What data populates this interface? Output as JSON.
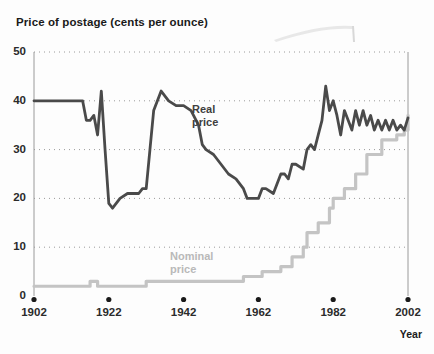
{
  "chart_data": {
    "type": "line",
    "title": "Price of postage (cents per ounce)",
    "xlabel": "Year",
    "ylabel": "",
    "xlim": [
      1902,
      2002
    ],
    "ylim": [
      0,
      50
    ],
    "grid": "dotted-horizontal",
    "legend": "inline-annotations",
    "y_ticks": [
      0,
      10,
      20,
      30,
      40,
      50
    ],
    "x_ticks": [
      1902,
      1922,
      1942,
      1962,
      1982,
      2002
    ],
    "annotations": [
      {
        "name": "real-price",
        "text_line1": "Real",
        "text_line2": "price",
        "color": "#4a4a4a"
      },
      {
        "name": "nominal-price",
        "text_line1": "Nominal",
        "text_line2": "price",
        "color": "#b9b9b9"
      }
    ],
    "series": [
      {
        "name": "Real price",
        "color": "#4a4a4a",
        "x": [
          1902,
          1907,
          1912,
          1915,
          1916,
          1917,
          1918,
          1919,
          1920,
          1921,
          1922,
          1923,
          1925,
          1927,
          1929,
          1930,
          1931,
          1932,
          1933,
          1934,
          1936,
          1938,
          1940,
          1942,
          1944,
          1946,
          1947,
          1948,
          1950,
          1952,
          1954,
          1956,
          1958,
          1959,
          1960,
          1962,
          1963,
          1964,
          1966,
          1968,
          1969,
          1970,
          1971,
          1972,
          1974,
          1975,
          1976,
          1977,
          1978,
          1979,
          1980,
          1981,
          1982,
          1983,
          1984,
          1985,
          1986,
          1987,
          1988,
          1989,
          1990,
          1991,
          1992,
          1993,
          1994,
          1995,
          1996,
          1997,
          1998,
          1999,
          2000,
          2001,
          2002
        ],
        "y": [
          40,
          40,
          40,
          40,
          36,
          36,
          37,
          33,
          42,
          30,
          19,
          18,
          20,
          21,
          21,
          21,
          22,
          22,
          30,
          38,
          42,
          40,
          39,
          39,
          38,
          35,
          31,
          30,
          29,
          27,
          25,
          24,
          22,
          20,
          20,
          20,
          22,
          22,
          21,
          25,
          25,
          24,
          27,
          27,
          26,
          30,
          31,
          30,
          33,
          36,
          43,
          38,
          40,
          37,
          33,
          38,
          36,
          34,
          38,
          35,
          38,
          35,
          37,
          34,
          36,
          34,
          36,
          34,
          36,
          34,
          35,
          34,
          36.5
        ],
        "end_value": 36.5
      },
      {
        "name": "Nominal price",
        "color": "#c4c4c4",
        "x": [
          1902,
          1915,
          1917,
          1918,
          1919,
          1921,
          1932,
          1958,
          1963,
          1968,
          1971,
          1974,
          1975,
          1978,
          1981,
          1982,
          1985,
          1988,
          1991,
          1995,
          1999,
          2001,
          2002
        ],
        "y": [
          2,
          2,
          3,
          3,
          2,
          2,
          3,
          4,
          5,
          6,
          8,
          10,
          13,
          15,
          18,
          20,
          22,
          25,
          29,
          32,
          33,
          34,
          37
        ],
        "step": true,
        "end_value": 37
      }
    ]
  },
  "chart": {
    "title": "Price of postage (cents per ounce)",
    "x_axis_title": "Year",
    "y_tick_labels": [
      "0",
      "10",
      "20",
      "30",
      "40",
      "50"
    ],
    "x_tick_labels": [
      "1902",
      "1922",
      "1942",
      "1962",
      "1982",
      "2002"
    ],
    "real_label_line1": "Real",
    "real_label_line2": "price",
    "nominal_label_line1": "Nominal",
    "nominal_label_line2": "price"
  },
  "colors": {
    "real_line": "#4a4a4a",
    "nominal_line": "#c4c4c4",
    "gridline": "#9a9a9a",
    "axis_text": "#2b2b2b",
    "background": "#fdfdfd"
  }
}
